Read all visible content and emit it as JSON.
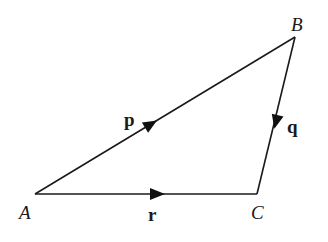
{
  "diagram": {
    "type": "vector-triangle",
    "colors": {
      "line": "#1a1a1a",
      "background": "#ffffff"
    },
    "vertices": [
      {
        "id": "A",
        "label": "A",
        "x": 35,
        "y": 194,
        "label_x": 19,
        "label_y": 219
      },
      {
        "id": "B",
        "label": "B",
        "x": 295,
        "y": 37,
        "label_x": 291,
        "label_y": 31
      },
      {
        "id": "C",
        "label": "C",
        "x": 257,
        "y": 194,
        "label_x": 251,
        "label_y": 219
      }
    ],
    "vectors": [
      {
        "id": "p",
        "label": "p",
        "from": "A",
        "to": "B",
        "label_x": 124,
        "label_y": 126
      },
      {
        "id": "q",
        "label": "q",
        "from": "B",
        "to": "C",
        "label_x": 287,
        "label_y": 133
      },
      {
        "id": "r",
        "label": "r",
        "from": "A",
        "to": "C",
        "label_x": 148,
        "label_y": 221
      }
    ]
  }
}
